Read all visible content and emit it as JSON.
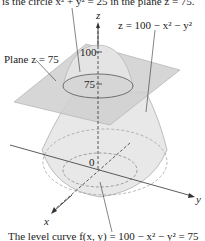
{
  "figure": {
    "top_caption": "is the circle x² + y² = 25 in the plane z = 75.",
    "surface_label": "z = 100 − x² − y²",
    "plane_label": "Plane z = 75",
    "axis_z": "z",
    "axis_x": "x",
    "axis_y": "y",
    "tick_100": "100",
    "tick_75": "75",
    "origin": "0",
    "bottom_caption": "The level curve f(x, y) = 100 − x² − y² = 75"
  },
  "colors": {
    "surface": "#e4e4e4",
    "plane": "#c9c9c9",
    "lines": "#333333"
  }
}
